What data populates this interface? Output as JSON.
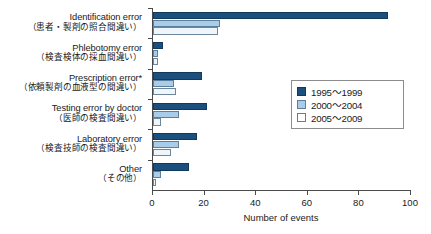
{
  "chart_data": {
    "type": "bar",
    "orientation": "horizontal",
    "title": "",
    "xlabel": "Number of events",
    "ylabel": "",
    "xlim": [
      0,
      100
    ],
    "xticks": [
      0,
      20,
      40,
      60,
      80,
      100
    ],
    "grid": false,
    "legend_position": "middle-right",
    "categories": [
      {
        "en": "Identification error",
        "jp": "（患者・製剤の照合間違い）"
      },
      {
        "en": "Phlebotomy error",
        "jp": "（検査検体の採血間違い）"
      },
      {
        "en": "Prescription error*",
        "jp": "（依頼製剤の血液型の間違い）"
      },
      {
        "en": "Testing error by doctor",
        "jp": "（医師の検査間違い）"
      },
      {
        "en": "Laboratory error",
        "jp": "（検査技師の検査間違い）"
      },
      {
        "en": "Other",
        "jp": "（その他）"
      }
    ],
    "series": [
      {
        "name": "1995~1999",
        "color": "#1b4f7d",
        "values": [
          91,
          4,
          19,
          21,
          17,
          14
        ]
      },
      {
        "name": "2000~2004",
        "color": "#a9cde9",
        "values": [
          26,
          2,
          8,
          10,
          10,
          3
        ]
      },
      {
        "name": "2005~2009",
        "color": "#eef5fb",
        "values": [
          25,
          2,
          9,
          3,
          7,
          1
        ]
      }
    ]
  },
  "legend": {
    "items": [
      {
        "label": "1995～1999"
      },
      {
        "label": "2000～2004"
      },
      {
        "label": "2005～2009"
      }
    ]
  },
  "axis": {
    "x_title": "Number of events",
    "x_tick_labels": [
      "0",
      "20",
      "40",
      "60",
      "80",
      "100"
    ]
  }
}
